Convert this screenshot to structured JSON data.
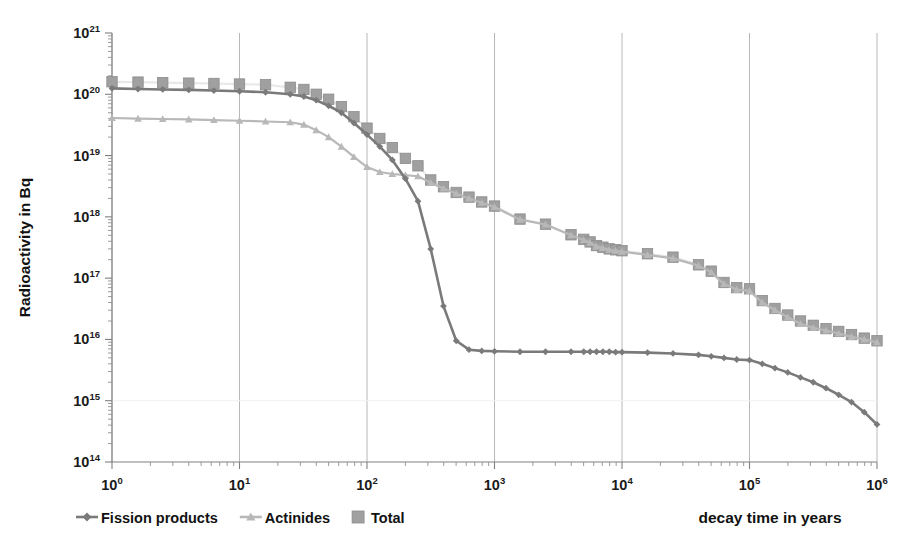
{
  "chart_data": {
    "type": "line",
    "title": "",
    "xlabel": "decay time in years",
    "ylabel": "Radioactivity in Bq",
    "xscale": "log",
    "yscale": "log",
    "xlim": [
      1,
      1000000
    ],
    "ylim": [
      100000000000000.0,
      1e+21
    ],
    "grid": "vertical-decades",
    "legend_position": "bottom-left",
    "xticklabels": [
      "10^0",
      "10^1",
      "10^2",
      "10^3",
      "10^4",
      "10^5",
      "10^6"
    ],
    "xtickvalues": [
      1,
      10,
      100,
      1000,
      10000,
      100000,
      1000000
    ],
    "yticklabels": [
      "10^14",
      "10^15",
      "10^16",
      "10^17",
      "10^18",
      "10^19",
      "10^20",
      "10^21"
    ],
    "ytickvalues": [
      100000000000000.0,
      1000000000000000.0,
      1e+16,
      1e+17,
      1e+18,
      1e+19,
      1e+20,
      1e+21
    ],
    "series": [
      {
        "name": "Fission products",
        "color": "#7a7a7a",
        "marker": "diamond",
        "marker_color": "#7a7a7a",
        "points": [
          [
            1.0,
            1.25e+20
          ],
          [
            1.6,
            1.22e+20
          ],
          [
            2.5,
            1.2e+20
          ],
          [
            4.0,
            1.18e+20
          ],
          [
            6.3,
            1.15e+20
          ],
          [
            10.0,
            1.12e+20
          ],
          [
            16.0,
            1.08e+20
          ],
          [
            25.0,
            1e+20
          ],
          [
            32.0,
            9.2e+19
          ],
          [
            40.0,
            8e+19
          ],
          [
            50.0,
            6.5e+19
          ],
          [
            63.0,
            5e+19
          ],
          [
            79.0,
            3.4e+19
          ],
          [
            100.0,
            2.2e+19
          ],
          [
            126.0,
            1.4e+19
          ],
          [
            158.0,
            8.5e+18
          ],
          [
            200.0,
            4.2e+18
          ],
          [
            251.0,
            1.8e+18
          ],
          [
            316.0,
            3e+17
          ],
          [
            398.0,
            3.5e+16
          ],
          [
            501.0,
            9500000000000000.0
          ],
          [
            631.0,
            6800000000000000.0
          ],
          [
            794.0,
            6500000000000000.0
          ],
          [
            1000.0,
            6400000000000000.0
          ],
          [
            1585.0,
            6300000000000000.0
          ],
          [
            2512.0,
            6300000000000000.0
          ],
          [
            3981.0,
            6300000000000000.0
          ],
          [
            5012.0,
            6300000000000000.0
          ],
          [
            5623.0,
            6300000000000000.0
          ],
          [
            6310.0,
            6300000000000000.0
          ],
          [
            7079.0,
            6300000000000000.0
          ],
          [
            7943.0,
            6300000000000000.0
          ],
          [
            8913.0,
            6200000000000000.0
          ],
          [
            10000.0,
            6200000000000000.0
          ],
          [
            15849.0,
            6100000000000000.0
          ],
          [
            25119.0,
            5900000000000000.0
          ],
          [
            39811.0,
            5600000000000000.0
          ],
          [
            50119.0,
            5300000000000000.0
          ],
          [
            63096.0,
            5000000000000000.0
          ],
          [
            79433.0,
            4700000000000000.0
          ],
          [
            100000.0,
            4600000000000000.0
          ],
          [
            125893.0,
            4000000000000000.0
          ],
          [
            158489.0,
            3400000000000000.0
          ],
          [
            199526.0,
            2900000000000000.0
          ],
          [
            251189.0,
            2400000000000000.0
          ],
          [
            316228.0,
            2000000000000000.0
          ],
          [
            398107.0,
            1600000000000000.0
          ],
          [
            501187.0,
            1250000000000000.0
          ],
          [
            630957.0,
            950000000000000.0
          ],
          [
            794328.0,
            650000000000000.0
          ],
          [
            1000000.0,
            410000000000000.0
          ]
        ]
      },
      {
        "name": "Actinides",
        "color": "#b8b8b8",
        "marker": "triangle",
        "marker_color": "#b8b8b8",
        "points": [
          [
            1.0,
            4.1e+19
          ],
          [
            1.6,
            4e+19
          ],
          [
            2.5,
            3.95e+19
          ],
          [
            4.0,
            3.9e+19
          ],
          [
            6.3,
            3.8e+19
          ],
          [
            10.0,
            3.7e+19
          ],
          [
            16.0,
            3.6e+19
          ],
          [
            25.0,
            3.5e+19
          ],
          [
            32.0,
            3.2e+19
          ],
          [
            40.0,
            2.6e+19
          ],
          [
            50.0,
            2e+19
          ],
          [
            63.0,
            1.4e+19
          ],
          [
            79.0,
            9.5e+18
          ],
          [
            100.0,
            6.5e+18
          ],
          [
            126.0,
            5.4e+18
          ],
          [
            158.0,
            5e+18
          ],
          [
            200.0,
            4.8e+18
          ],
          [
            251.0,
            4.6e+18
          ],
          [
            316.0,
            3.6e+18
          ],
          [
            398.0,
            2.9e+18
          ],
          [
            501.0,
            2.4e+18
          ],
          [
            631.0,
            2e+18
          ],
          [
            794.0,
            1.7e+18
          ],
          [
            1000.0,
            1.45e+18
          ],
          [
            1585.0,
            9e+17
          ],
          [
            2512.0,
            7.5e+17
          ],
          [
            3981.0,
            5e+17
          ],
          [
            5012.0,
            4.2e+17
          ],
          [
            5623.0,
            3.8e+17
          ],
          [
            6310.0,
            3.3e+17
          ],
          [
            7079.0,
            3.1e+17
          ],
          [
            7943.0,
            2.9e+17
          ],
          [
            8913.0,
            2.8e+17
          ],
          [
            10000.0,
            2.7e+17
          ],
          [
            15849.0,
            2.4e+17
          ],
          [
            25119.0,
            2.1e+17
          ],
          [
            39811.0,
            1.6e+17
          ],
          [
            50119.0,
            1.25e+17
          ],
          [
            63096.0,
            8e+16
          ],
          [
            79433.0,
            6.5e+16
          ],
          [
            100000.0,
            6.2e+16
          ],
          [
            125893.0,
            4e+16
          ],
          [
            158489.0,
            3e+16
          ],
          [
            199526.0,
            2.3e+16
          ],
          [
            251189.0,
            1.8e+16
          ],
          [
            316228.0,
            1.55e+16
          ],
          [
            398107.0,
            1.4e+16
          ],
          [
            501187.0,
            1.25e+16
          ],
          [
            630957.0,
            1.1e+16
          ],
          [
            794328.0,
            1e+16
          ],
          [
            1000000.0,
            9000000000000000.0
          ]
        ]
      },
      {
        "name": "Total",
        "color": "#e8e8e8",
        "marker": "square",
        "marker_color": "#a0a0a0",
        "points": [
          [
            1.0,
            1.6e+20
          ],
          [
            1.6,
            1.58e+20
          ],
          [
            2.5,
            1.55e+20
          ],
          [
            4.0,
            1.52e+20
          ],
          [
            6.3,
            1.5e+20
          ],
          [
            10.0,
            1.47e+20
          ],
          [
            16.0,
            1.43e+20
          ],
          [
            25.0,
            1.3e+20
          ],
          [
            32.0,
            1.2e+20
          ],
          [
            40.0,
            1e+20
          ],
          [
            50.0,
            8.3e+19
          ],
          [
            63.0,
            6.3e+19
          ],
          [
            79.0,
            4.3e+19
          ],
          [
            100.0,
            2.8e+19
          ],
          [
            126.0,
            1.9e+19
          ],
          [
            158.0,
            1.35e+19
          ],
          [
            200.0,
            9e+18
          ],
          [
            251.0,
            6.8e+18
          ],
          [
            316.0,
            4e+18
          ],
          [
            398.0,
            3.1e+18
          ],
          [
            501.0,
            2.5e+18
          ],
          [
            631.0,
            2.1e+18
          ],
          [
            794.0,
            1.75e+18
          ],
          [
            1000.0,
            1.5e+18
          ],
          [
            1585.0,
            9.2e+17
          ],
          [
            2512.0,
            7.6e+17
          ],
          [
            3981.0,
            5.1e+17
          ],
          [
            5012.0,
            4.3e+17
          ],
          [
            5623.0,
            3.9e+17
          ],
          [
            6310.0,
            3.4e+17
          ],
          [
            7079.0,
            3.2e+17
          ],
          [
            7943.0,
            3e+17
          ],
          [
            8913.0,
            2.9e+17
          ],
          [
            10000.0,
            2.8e+17
          ],
          [
            15849.0,
            2.5e+17
          ],
          [
            25119.0,
            2.2e+17
          ],
          [
            39811.0,
            1.65e+17
          ],
          [
            50119.0,
            1.3e+17
          ],
          [
            63096.0,
            8.5e+16
          ],
          [
            79433.0,
            7e+16
          ],
          [
            100000.0,
            6.7e+16
          ],
          [
            125893.0,
            4.3e+16
          ],
          [
            158489.0,
            3.2e+16
          ],
          [
            199526.0,
            2.5e+16
          ],
          [
            251189.0,
            2e+16
          ],
          [
            316228.0,
            1.7e+16
          ],
          [
            398107.0,
            1.5e+16
          ],
          [
            501187.0,
            1.35e+16
          ],
          [
            630957.0,
            1.2e+16
          ],
          [
            794328.0,
            1.05e+16
          ],
          [
            1000000.0,
            9500000000000000.0
          ]
        ]
      }
    ]
  },
  "legend": {
    "items": [
      {
        "label": "Fission products",
        "marker": "diamond",
        "color": "#7a7a7a"
      },
      {
        "label": "Actinides",
        "marker": "triangle",
        "color": "#b8b8b8"
      },
      {
        "label": "Total",
        "marker": "square",
        "color": "#a0a0a0"
      }
    ]
  },
  "axes": {
    "x_title": "decay time in years",
    "y_title": "Radioactivity in Bq"
  },
  "colors": {
    "fission": "#7a7a7a",
    "actinides": "#b8b8b8",
    "total_line": "#e8e8e8",
    "total_marker": "#a0a0a0",
    "axis": "#808080",
    "grid": "#b0b0b0",
    "text": "#111111",
    "background": "#ffffff"
  }
}
